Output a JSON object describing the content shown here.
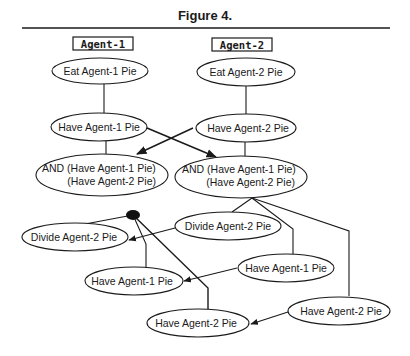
{
  "figure": {
    "title": "Figure 4."
  },
  "columns": {
    "agent1": "Agent-1",
    "agent2": "Agent-2"
  },
  "nodes": {
    "eat_agent1": "Eat  Agent-1  Pie",
    "eat_agent2": "Eat  Agent-2  Pie",
    "have_agent1_top": "Have  Agent-1  Pie",
    "have_agent2_top": "Have  Agent-2  Pie",
    "and_left": {
      "line1": "AND  (Have  Agent-1  Pie)",
      "line2": "(Have  Agent-2  Pie)"
    },
    "and_right": {
      "line1": "AND  (Have  Agent-1  Pie)",
      "line2": "(Have  Agent-2  Pie)"
    },
    "divide_right": "Divide  Agent-2  Pie",
    "divide_left": "Divide  Agent-2  Pie",
    "have_agent1_right": "Have  Agent-1  Pie",
    "have_agent1_left": "Have  Agent-1  Pie",
    "have_agent2_right": "Have  Agent-2  Pie",
    "have_agent2_bottom": "Have  Agent-2  Pie"
  },
  "colors": {
    "ink": "#1a1a1a",
    "background": "#ffffff"
  }
}
